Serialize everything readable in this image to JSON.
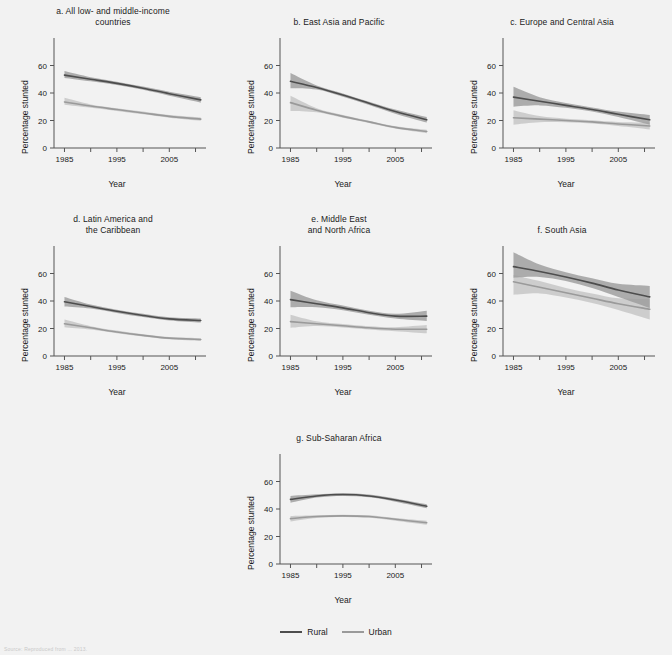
{
  "figure": {
    "background": "#f2f2f2",
    "xlabel": "Year",
    "ylabel": "Percentage stunted",
    "source_note": "Source: Reproduced from ... 2013."
  },
  "legend": {
    "position": "bottom-center",
    "items": [
      {
        "label": "Rural",
        "color": "#4d4d4d"
      },
      {
        "label": "Urban",
        "color": "#9a9a9a"
      }
    ]
  },
  "axes": {
    "xlim": [
      1983,
      2012
    ],
    "ylim": [
      0,
      80
    ],
    "yticks": [
      0,
      20,
      40,
      60
    ],
    "ytick_labels": [
      "0",
      "20",
      "40",
      "60"
    ],
    "xticks": [
      1985,
      1990,
      1995,
      2000,
      2005,
      2010
    ],
    "xtick_labels": [
      "1985",
      "",
      "1995",
      "",
      "2005",
      ""
    ],
    "grid": false
  },
  "chart_data": [
    {
      "type": "line",
      "id": "a",
      "title": "a. All low- and middle-income\ncountries",
      "xlabel": "Year",
      "ylabel": "Percentage stunted",
      "xlim": [
        1983,
        2012
      ],
      "ylim": [
        0,
        80
      ],
      "x": [
        1985,
        1990,
        1995,
        2000,
        2005,
        2011
      ],
      "series": [
        {
          "name": "Rural",
          "color": "#4d4d4d",
          "values": [
            53.0,
            50.0,
            47.0,
            43.5,
            39.5,
            35.0
          ],
          "lower": [
            51.0,
            48.5,
            45.8,
            42.3,
            38.0,
            33.0
          ],
          "upper": [
            56.0,
            51.5,
            48.2,
            44.7,
            41.0,
            37.0
          ]
        },
        {
          "name": "Urban",
          "color": "#9a9a9a",
          "values": [
            33.5,
            30.5,
            28.0,
            25.5,
            23.0,
            21.0
          ],
          "lower": [
            31.5,
            29.3,
            27.0,
            24.5,
            22.0,
            19.8
          ],
          "upper": [
            36.5,
            31.7,
            29.0,
            26.5,
            24.0,
            22.2
          ]
        }
      ]
    },
    {
      "type": "line",
      "id": "b",
      "title": "b. East Asia and Pacific",
      "xlabel": "Year",
      "ylabel": "Percentage stunted",
      "xlim": [
        1983,
        2012
      ],
      "ylim": [
        0,
        80
      ],
      "x": [
        1985,
        1990,
        1995,
        2000,
        2005,
        2011
      ],
      "series": [
        {
          "name": "Rural",
          "color": "#4d4d4d",
          "values": [
            48.5,
            44.0,
            38.5,
            32.5,
            26.5,
            20.5
          ],
          "lower": [
            43.5,
            42.5,
            37.3,
            31.3,
            25.0,
            18.5
          ],
          "upper": [
            54.5,
            45.5,
            39.7,
            33.7,
            28.0,
            22.5
          ]
        },
        {
          "name": "Urban",
          "color": "#9a9a9a",
          "values": [
            33.0,
            27.5,
            23.0,
            19.0,
            15.0,
            12.0
          ],
          "lower": [
            27.0,
            26.0,
            22.0,
            18.2,
            14.2,
            10.8
          ],
          "upper": [
            38.0,
            29.0,
            24.0,
            19.8,
            15.8,
            13.2
          ]
        }
      ]
    },
    {
      "type": "line",
      "id": "c",
      "title": "c. Europe and Central Asia",
      "xlabel": "Year",
      "ylabel": "Percentage stunted",
      "xlim": [
        1983,
        2012
      ],
      "ylim": [
        0,
        80
      ],
      "x": [
        1985,
        1990,
        1995,
        2000,
        2005,
        2011
      ],
      "series": [
        {
          "name": "Rural",
          "color": "#4d4d4d",
          "values": [
            37.0,
            34.0,
            31.0,
            28.0,
            24.5,
            20.5
          ],
          "lower": [
            30.0,
            31.0,
            29.2,
            26.5,
            22.5,
            17.0
          ],
          "upper": [
            44.5,
            37.0,
            32.8,
            29.5,
            26.5,
            24.0
          ]
        },
        {
          "name": "Urban",
          "color": "#9a9a9a",
          "values": [
            22.0,
            21.0,
            20.0,
            19.0,
            17.5,
            16.0
          ],
          "lower": [
            17.0,
            18.8,
            18.7,
            17.8,
            16.0,
            13.5
          ],
          "upper": [
            27.5,
            23.2,
            21.3,
            20.2,
            19.0,
            18.5
          ]
        }
      ]
    },
    {
      "type": "line",
      "id": "d",
      "title": "d. Latin America and\nthe Caribbean",
      "xlabel": "Year",
      "ylabel": "Percentage stunted",
      "xlim": [
        1983,
        2012
      ],
      "ylim": [
        0,
        80
      ],
      "x": [
        1985,
        1990,
        1995,
        2000,
        2005,
        2011
      ],
      "series": [
        {
          "name": "Rural",
          "color": "#4d4d4d",
          "values": [
            39.5,
            36.0,
            32.5,
            29.5,
            27.0,
            25.8
          ],
          "lower": [
            36.0,
            34.5,
            31.3,
            28.3,
            25.8,
            24.3
          ],
          "upper": [
            43.0,
            37.5,
            33.7,
            30.7,
            28.2,
            27.3
          ]
        },
        {
          "name": "Urban",
          "color": "#9a9a9a",
          "values": [
            23.5,
            20.5,
            17.5,
            15.0,
            13.0,
            12.0
          ],
          "lower": [
            21.0,
            19.3,
            16.5,
            14.2,
            12.2,
            11.0
          ],
          "upper": [
            26.5,
            21.7,
            18.5,
            15.8,
            13.8,
            13.0
          ]
        }
      ]
    },
    {
      "type": "line",
      "id": "e",
      "title": "e. Middle East\nand North Africa",
      "xlabel": "Year",
      "ylabel": "Percentage stunted",
      "xlim": [
        1983,
        2012
      ],
      "ylim": [
        0,
        80
      ],
      "x": [
        1985,
        1990,
        1995,
        2000,
        2005,
        2011
      ],
      "series": [
        {
          "name": "Rural",
          "color": "#4d4d4d",
          "values": [
            41.0,
            38.0,
            35.0,
            31.5,
            29.0,
            29.0
          ],
          "lower": [
            35.5,
            35.5,
            33.3,
            30.0,
            27.3,
            25.5
          ],
          "upper": [
            47.5,
            40.5,
            36.7,
            33.0,
            30.7,
            33.0
          ]
        },
        {
          "name": "Urban",
          "color": "#9a9a9a",
          "values": [
            25.0,
            23.5,
            22.0,
            20.5,
            19.5,
            19.5
          ],
          "lower": [
            20.5,
            21.8,
            20.8,
            19.3,
            18.0,
            16.5
          ],
          "upper": [
            30.0,
            25.2,
            23.2,
            21.7,
            21.0,
            22.5
          ]
        }
      ]
    },
    {
      "type": "line",
      "id": "f",
      "title": "f. South Asia",
      "xlabel": "Year",
      "ylabel": "Percentage stunted",
      "xlim": [
        1983,
        2012
      ],
      "ylim": [
        0,
        80
      ],
      "x": [
        1985,
        1990,
        1995,
        2000,
        2005,
        2011
      ],
      "series": [
        {
          "name": "Rural",
          "color": "#4d4d4d",
          "values": [
            65.0,
            61.5,
            57.5,
            53.0,
            48.0,
            43.0
          ],
          "lower": [
            57.0,
            57.5,
            54.5,
            49.5,
            43.0,
            35.0
          ],
          "upper": [
            75.5,
            66.5,
            61.0,
            56.5,
            52.5,
            51.0
          ]
        },
        {
          "name": "Urban",
          "color": "#9a9a9a",
          "values": [
            54.0,
            50.0,
            46.0,
            42.0,
            38.0,
            34.0
          ],
          "lower": [
            44.5,
            45.5,
            42.5,
            38.5,
            33.5,
            26.5
          ],
          "upper": [
            59.0,
            54.5,
            49.5,
            45.5,
            42.0,
            41.5
          ]
        }
      ]
    },
    {
      "type": "line",
      "id": "g",
      "title": "g. Sub-Saharan Africa",
      "xlabel": "Year",
      "ylabel": "Percentage stunted",
      "xlim": [
        1983,
        2012
      ],
      "ylim": [
        0,
        80
      ],
      "x": [
        1985,
        1990,
        1995,
        2000,
        2005,
        2011
      ],
      "series": [
        {
          "name": "Rural",
          "color": "#4d4d4d",
          "values": [
            47.0,
            49.5,
            50.5,
            49.5,
            46.5,
            42.0
          ],
          "lower": [
            44.5,
            48.3,
            49.5,
            48.5,
            45.3,
            40.5
          ],
          "upper": [
            49.5,
            50.7,
            51.5,
            50.5,
            47.7,
            43.5
          ]
        },
        {
          "name": "Urban",
          "color": "#9a9a9a",
          "values": [
            33.0,
            34.5,
            35.0,
            34.5,
            32.5,
            30.0
          ],
          "lower": [
            31.0,
            33.5,
            34.1,
            33.6,
            31.5,
            28.5
          ],
          "upper": [
            35.0,
            35.5,
            35.9,
            35.4,
            33.5,
            31.5
          ]
        }
      ]
    }
  ],
  "layout": {
    "panels": [
      {
        "id": "a",
        "left": 0,
        "top": 4,
        "width": 226,
        "height": 200
      },
      {
        "id": "b",
        "left": 226,
        "top": 4,
        "width": 226,
        "height": 200
      },
      {
        "id": "c",
        "left": 452,
        "top": 4,
        "width": 220,
        "height": 200
      },
      {
        "id": "d",
        "left": 0,
        "top": 212,
        "width": 226,
        "height": 200
      },
      {
        "id": "e",
        "left": 226,
        "top": 212,
        "width": 226,
        "height": 200
      },
      {
        "id": "f",
        "left": 452,
        "top": 212,
        "width": 220,
        "height": 200
      },
      {
        "id": "g",
        "left": 226,
        "top": 420,
        "width": 226,
        "height": 200
      }
    ]
  }
}
